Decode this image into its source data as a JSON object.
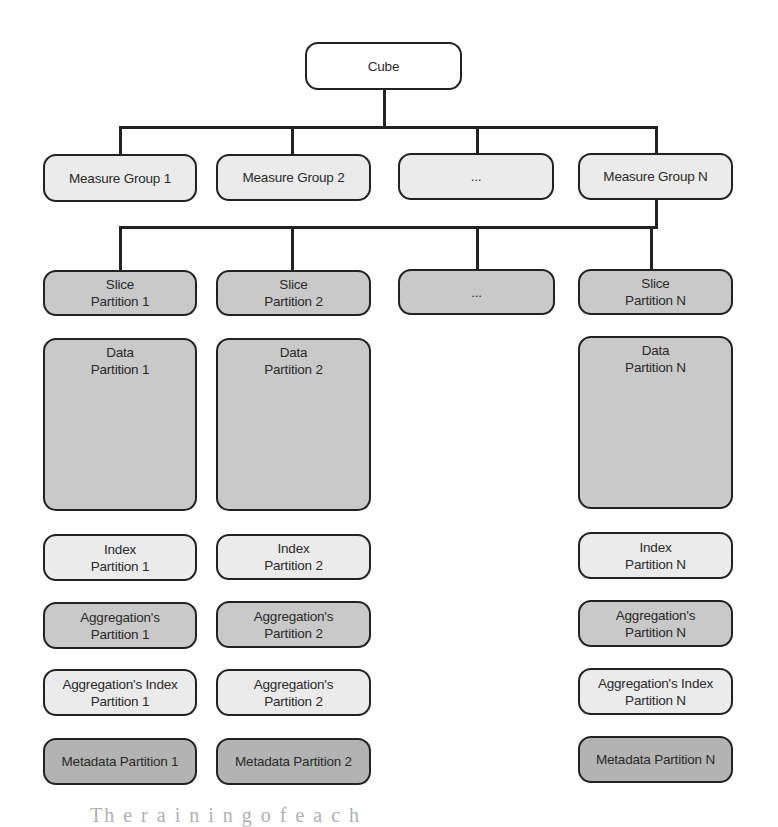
{
  "diagram": {
    "root": {
      "label": "Cube"
    },
    "measure_groups": [
      {
        "label": "Measure Group 1"
      },
      {
        "label": "Measure Group 2"
      },
      {
        "label": "..."
      },
      {
        "label": "Measure Group N"
      }
    ],
    "slices": [
      {
        "line1": "Slice",
        "line2": "Partition 1"
      },
      {
        "line1": "Slice",
        "line2": "Partition 2"
      },
      {
        "line1": "...",
        "line2": ""
      },
      {
        "line1": "Slice",
        "line2": "Partition N"
      }
    ],
    "partition_columns": [
      {
        "data": {
          "line1": "Data",
          "line2": "Partition 1"
        },
        "index": {
          "line1": "Index",
          "line2": "Partition 1"
        },
        "aggregations": {
          "line1": "Aggregation's",
          "line2": "Partition 1"
        },
        "aggregation_index": {
          "line1": "Aggregation's Index",
          "line2": "Partition 1"
        },
        "metadata": {
          "label": "Metadata Partition 1"
        }
      },
      {
        "data": {
          "line1": "Data",
          "line2": "Partition 2"
        },
        "index": {
          "line1": "Index",
          "line2": "Partition 2"
        },
        "aggregations": {
          "line1": "Aggregation's",
          "line2": "Partition 2"
        },
        "aggregation_index": {
          "line1": "Aggregation's",
          "line2": "Partition 2"
        },
        "metadata": {
          "label": "Metadata Partition 2"
        }
      },
      {
        "data": {
          "line1": "Data",
          "line2": "Partition N"
        },
        "index": {
          "line1": "Index",
          "line2": "Partition N"
        },
        "aggregations": {
          "line1": "Aggregation's",
          "line2": "Partition N"
        },
        "aggregation_index": {
          "line1": "Aggregation's Index",
          "line2": "Partition N"
        },
        "metadata": {
          "label": "Metadata Partition N"
        }
      }
    ],
    "colors": {
      "stroke": "#222222",
      "white_fill": "#ffffff",
      "light_fill": "#ebebeb",
      "medium_fill": "#c9c9c9",
      "dark_fill": "#b3b3b3"
    }
  },
  "caption": {
    "text": "Th  e        r  a  i  n  i  n  g    o  f    e  a  c  h"
  }
}
